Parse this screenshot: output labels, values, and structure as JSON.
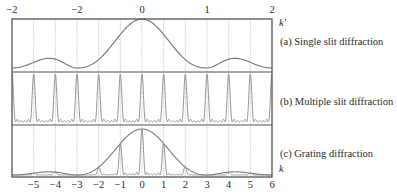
{
  "figure": {
    "top_axis": {
      "name": "k'",
      "tick_labels": [
        "−2",
        "−2",
        "0",
        "1",
        "2"
      ],
      "tick_values": [
        -2,
        -1,
        0,
        1,
        2
      ]
    },
    "bottom_axis": {
      "name": "k",
      "tick_labels": [
        "−5",
        "−4",
        "−3",
        "−2",
        "−1",
        "0",
        "1",
        "2",
        "3",
        "4",
        "5",
        "6"
      ],
      "tick_values": [
        -5,
        -4,
        -3,
        -2,
        -1,
        0,
        1,
        2,
        3,
        4,
        5,
        6
      ],
      "range": [
        -6,
        6
      ]
    },
    "panels": [
      {
        "id": "a",
        "caption": "(a) Single slit diffraction"
      },
      {
        "id": "b",
        "caption": "(b) Multiple slit diffraction"
      },
      {
        "id": "c",
        "caption": "(c) Grating diffraction"
      }
    ],
    "model": {
      "single_slit_zero_spacing_k": 3,
      "principal_maxima_spacing_k": 1,
      "secondary_maxima_between_principal": 4
    },
    "colors": {
      "frame": "#555555",
      "curve": "#7d7d7d",
      "guides": "#b8b8b8",
      "peaks": "#8a8a8a"
    }
  }
}
